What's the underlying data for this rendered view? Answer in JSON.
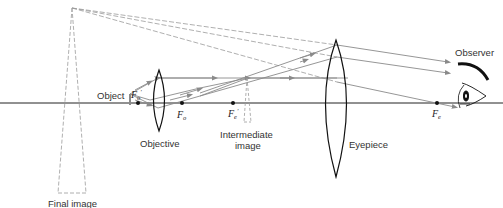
{
  "diagram": {
    "colors": {
      "axis": "#222222",
      "lens": "#111111",
      "ray": "#8a8a8a",
      "dashed": "#9a9a9a",
      "label": "#333333"
    },
    "labels": {
      "object": "Object",
      "objective": "Objective",
      "intermediate_image_line1": "Intermediate",
      "intermediate_image_line2": "image",
      "eyepiece": "Eyepiece",
      "observer": "Observer",
      "final_image": "Final image"
    },
    "focal_points": [
      {
        "id": "Fo_prime",
        "main": "F",
        "sub": "o",
        "prime": "′"
      },
      {
        "id": "Fo",
        "main": "F",
        "sub": "o",
        "prime": ""
      },
      {
        "id": "Fe_prime",
        "main": "F",
        "sub": "e",
        "prime": "′"
      },
      {
        "id": "Fe",
        "main": "F",
        "sub": "e",
        "prime": ""
      }
    ],
    "icons": [
      "eye-icon",
      "arrow-icon"
    ]
  }
}
